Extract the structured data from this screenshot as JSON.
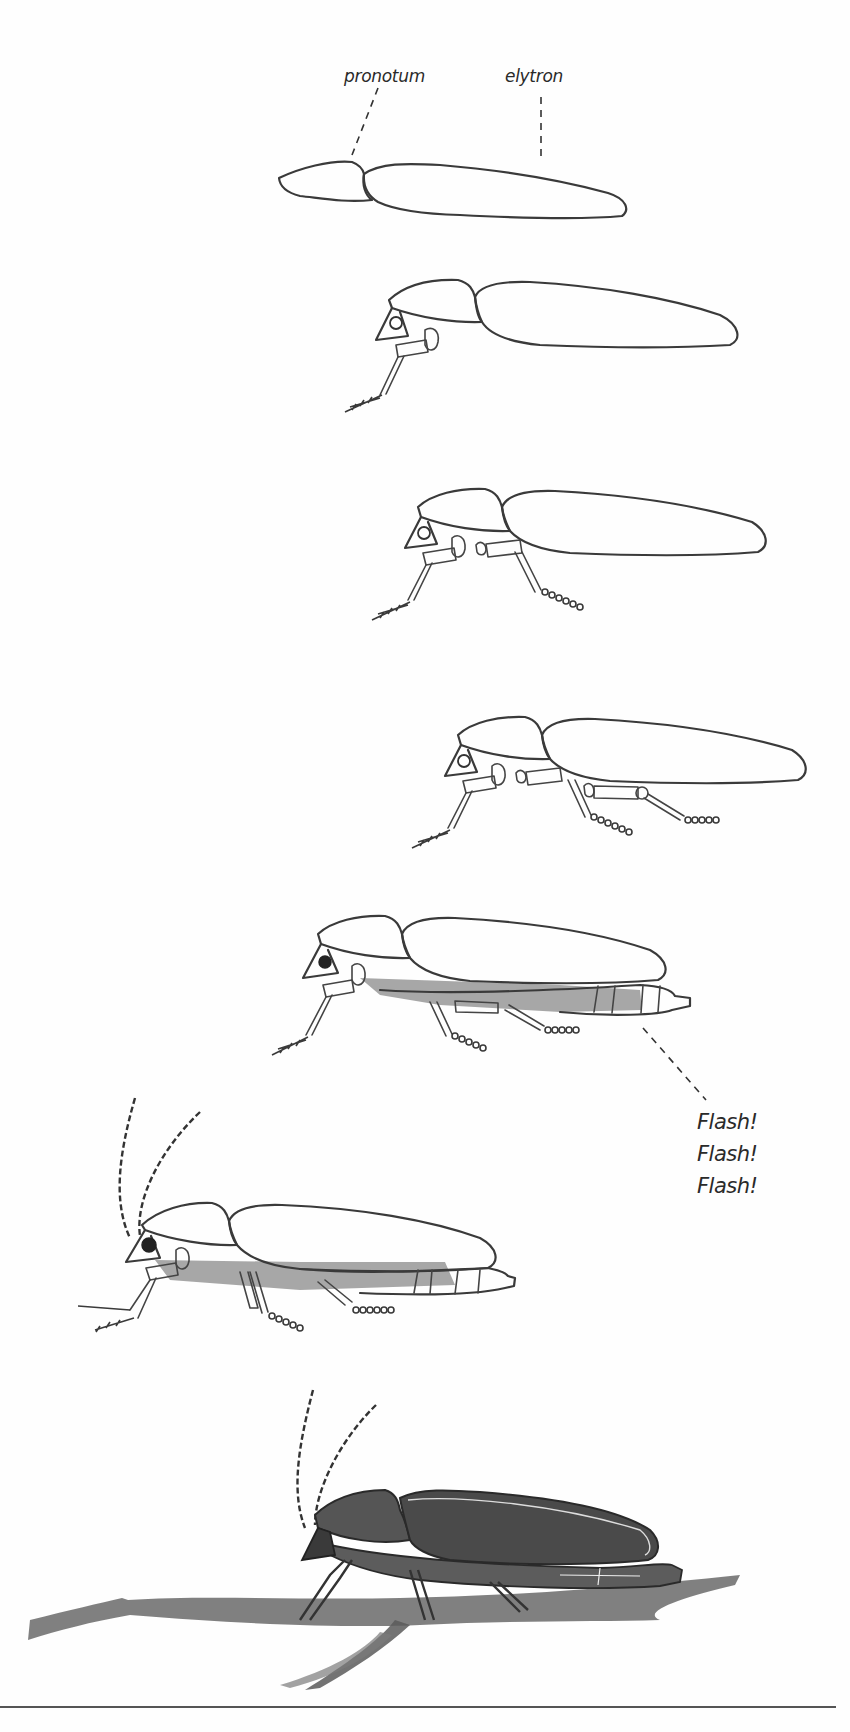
{
  "figure": {
    "labels": {
      "pronotum": "pronotum",
      "elytron": "elytron"
    },
    "flash_lines": [
      "Flash!",
      "Flash!",
      "Flash!"
    ],
    "stages": [
      {
        "step": 1,
        "description": "Outline of pronotum and elytron"
      },
      {
        "step": 2,
        "description": "Head, eye and first leg added"
      },
      {
        "step": 3,
        "description": "Second leg added"
      },
      {
        "step": 4,
        "description": "Third leg added"
      },
      {
        "step": 5,
        "description": "Abdomen shaded with lantern segments"
      },
      {
        "step": 6,
        "description": "Antennae and additional legs added"
      },
      {
        "step": 7,
        "description": "Fully shaded firefly on a twig"
      }
    ]
  },
  "colors": {
    "ink": "#3a3a3a",
    "background": "#fefefe",
    "shade": "#8a8a8a"
  }
}
